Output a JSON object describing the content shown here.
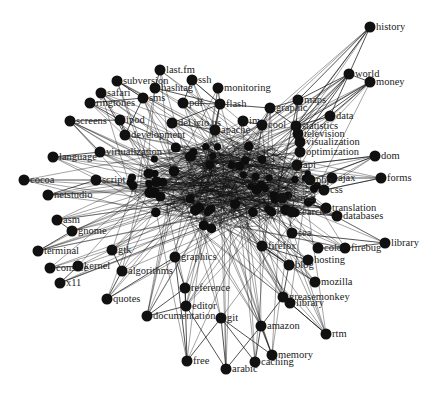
{
  "title": "",
  "colors": {
    "background": "#ffffff",
    "node": "#111111",
    "edge": "#1a1a1a",
    "label": "#222222"
  },
  "core": {
    "cx": 225,
    "cy": 185,
    "rx": 95,
    "ry": 45
  },
  "nodes": [
    {
      "id": "history",
      "label": "history",
      "x": 370,
      "y": 27
    },
    {
      "id": "world",
      "label": "world",
      "x": 349,
      "y": 74
    },
    {
      "id": "money",
      "label": "money",
      "x": 370,
      "y": 82
    },
    {
      "id": "maps",
      "label": "maps",
      "x": 298,
      "y": 100
    },
    {
      "id": "graphic",
      "label": "graphic",
      "x": 270,
      "y": 108
    },
    {
      "id": "data",
      "label": "data",
      "x": 330,
      "y": 116
    },
    {
      "id": "statistics",
      "label": "statistics",
      "x": 296,
      "y": 126
    },
    {
      "id": "television",
      "label": "television",
      "x": 298,
      "y": 134
    },
    {
      "id": "visualization",
      "label": "visualization",
      "x": 300,
      "y": 142
    },
    {
      "id": "optimization",
      "label": "optimization",
      "x": 300,
      "y": 152
    },
    {
      "id": "cool",
      "label": "cool",
      "x": 262,
      "y": 125
    },
    {
      "id": "im",
      "label": "im",
      "x": 243,
      "y": 121
    },
    {
      "id": "flash",
      "label": "flash",
      "x": 220,
      "y": 104
    },
    {
      "id": "monitoring",
      "label": "monitoring",
      "x": 218,
      "y": 88
    },
    {
      "id": "ssh",
      "label": "ssh",
      "x": 192,
      "y": 80
    },
    {
      "id": "pdf",
      "label": "pdf",
      "x": 183,
      "y": 103
    },
    {
      "id": "last.fm",
      "label": "last.fm",
      "x": 160,
      "y": 70
    },
    {
      "id": "hashtag",
      "label": "hashtag",
      "x": 155,
      "y": 88
    },
    {
      "id": "subversion",
      "label": "subversion",
      "x": 117,
      "y": 81
    },
    {
      "id": "safari",
      "label": "safari",
      "x": 101,
      "y": 93
    },
    {
      "id": "ringtones",
      "label": "ringtones",
      "x": 90,
      "y": 103
    },
    {
      "id": "sms",
      "label": "sms",
      "x": 143,
      "y": 98
    },
    {
      "id": "screens",
      "label": "screens",
      "x": 70,
      "y": 121
    },
    {
      "id": "ipod",
      "label": "ipod",
      "x": 120,
      "y": 120
    },
    {
      "id": "del.icio.us",
      "label": "del.icio.us",
      "x": 172,
      "y": 123
    },
    {
      "id": "apache",
      "label": "apache",
      "x": 215,
      "y": 130
    },
    {
      "id": "development",
      "label": "development",
      "x": 125,
      "y": 135
    },
    {
      "id": "virtualization",
      "label": "virtualization",
      "x": 100,
      "y": 152
    },
    {
      "id": "language",
      "label": "language",
      "x": 53,
      "y": 157
    },
    {
      "id": "cocoa",
      "label": "cocoa",
      "x": 24,
      "y": 180
    },
    {
      "id": "script",
      "label": "script",
      "x": 96,
      "y": 180
    },
    {
      "id": "netstudio",
      "label": "netstudio",
      "x": 48,
      "y": 195
    },
    {
      "id": "asm",
      "label": "asm",
      "x": 57,
      "y": 220
    },
    {
      "id": "gnome",
      "label": "gnome",
      "x": 72,
      "y": 231
    },
    {
      "id": "terminal",
      "label": "terminal",
      "x": 38,
      "y": 251
    },
    {
      "id": "console",
      "label": "console",
      "x": 50,
      "y": 268
    },
    {
      "id": "kernel",
      "label": "kernel",
      "x": 78,
      "y": 266
    },
    {
      "id": "x11",
      "label": "x11",
      "x": 60,
      "y": 283
    },
    {
      "id": "gtk",
      "label": "gtk",
      "x": 112,
      "y": 250
    },
    {
      "id": "algorithms",
      "label": "algorithms",
      "x": 122,
      "y": 271
    },
    {
      "id": "quotes",
      "label": "quotes",
      "x": 107,
      "y": 299
    },
    {
      "id": "graphics",
      "label": "graphics",
      "x": 175,
      "y": 257
    },
    {
      "id": "reference",
      "label": "reference",
      "x": 185,
      "y": 288
    },
    {
      "id": "editor",
      "label": "editor",
      "x": 186,
      "y": 306
    },
    {
      "id": "documentation",
      "label": "documentation",
      "x": 147,
      "y": 316
    },
    {
      "id": "git",
      "label": "git",
      "x": 221,
      "y": 318
    },
    {
      "id": "free",
      "label": "free",
      "x": 187,
      "y": 361
    },
    {
      "id": "arabic",
      "label": "arabic",
      "x": 226,
      "y": 369
    },
    {
      "id": "caching",
      "label": "caching",
      "x": 255,
      "y": 362
    },
    {
      "id": "memory",
      "label": "memory",
      "x": 272,
      "y": 355
    },
    {
      "id": "amazon",
      "label": "amazon",
      "x": 261,
      "y": 326
    },
    {
      "id": "greasemonkey",
      "label": "greasemonkey",
      "x": 283,
      "y": 297
    },
    {
      "id": "library2",
      "label": "library",
      "x": 290,
      "y": 303
    },
    {
      "id": "rtm",
      "label": "rtm",
      "x": 326,
      "y": 334
    },
    {
      "id": "mozilla",
      "label": "mozilla",
      "x": 315,
      "y": 282
    },
    {
      "id": "blog",
      "label": "blog",
      "x": 289,
      "y": 265
    },
    {
      "id": "hosting",
      "label": "hosting",
      "x": 308,
      "y": 260
    },
    {
      "id": "firefox",
      "label": "firefox",
      "x": 262,
      "y": 246
    },
    {
      "id": "color",
      "label": "color",
      "x": 318,
      "y": 248
    },
    {
      "id": "firebug",
      "label": "firebug",
      "x": 345,
      "y": 248
    },
    {
      "id": "library",
      "label": "library",
      "x": 385,
      "y": 243
    },
    {
      "id": "search2",
      "label": "sea",
      "x": 292,
      "y": 233
    },
    {
      "id": "databases",
      "label": "databases",
      "x": 337,
      "y": 216
    },
    {
      "id": "translation",
      "label": "translation",
      "x": 326,
      "y": 208
    },
    {
      "id": "search",
      "label": "search",
      "x": 292,
      "y": 212
    },
    {
      "id": "format",
      "label": "format",
      "x": 282,
      "y": 198
    },
    {
      "id": "css",
      "label": "css",
      "x": 324,
      "y": 190
    },
    {
      "id": "ajax",
      "label": "ajax",
      "x": 332,
      "y": 178
    },
    {
      "id": "php",
      "label": "php",
      "x": 310,
      "y": 180
    },
    {
      "id": "forms",
      "label": "forms",
      "x": 381,
      "y": 178
    },
    {
      "id": "dom",
      "label": "dom",
      "x": 375,
      "y": 156
    },
    {
      "id": "api",
      "label": "api",
      "x": 297,
      "y": 165
    }
  ],
  "edges": [
    [
      "history",
      "world"
    ],
    [
      "history",
      "maps"
    ],
    [
      "history",
      "statistics"
    ],
    [
      "world",
      "money"
    ],
    [
      "world",
      "maps"
    ],
    [
      "world",
      "data"
    ],
    [
      "world",
      "statistics"
    ],
    [
      "world",
      "television"
    ],
    [
      "world",
      "visualization"
    ],
    [
      "money",
      "statistics"
    ],
    [
      "money",
      "data"
    ],
    [
      "money",
      "television"
    ],
    [
      "maps",
      "graphic"
    ],
    [
      "maps",
      "statistics"
    ],
    [
      "graphic",
      "flash"
    ],
    [
      "graphic",
      "cool"
    ],
    [
      "graphic",
      "statistics"
    ],
    [
      "data",
      "statistics"
    ],
    [
      "flash",
      "monitoring"
    ],
    [
      "flash",
      "pdf"
    ],
    [
      "flash",
      "apache"
    ],
    [
      "flash",
      "del.icio.us"
    ],
    [
      "flash",
      "ssh"
    ],
    [
      "ssh",
      "pdf"
    ],
    [
      "last.fm",
      "hashtag"
    ],
    [
      "hashtag",
      "flash"
    ],
    [
      "subversion",
      "sms"
    ],
    [
      "safari",
      "development"
    ],
    [
      "ringtones",
      "ipod"
    ],
    [
      "ringtones",
      "sms"
    ],
    [
      "screens",
      "virtualization"
    ],
    [
      "screens",
      "ipod"
    ],
    [
      "ipod",
      "development"
    ],
    [
      "sms",
      "development"
    ],
    [
      "del.icio.us",
      "apache"
    ],
    [
      "im",
      "cool"
    ],
    [
      "language",
      "virtualization"
    ],
    [
      "cocoa",
      "script"
    ],
    [
      "netstudio",
      "script"
    ],
    [
      "asm",
      "gnome"
    ],
    [
      "terminal",
      "gnome"
    ],
    [
      "console",
      "kernel"
    ],
    [
      "x11",
      "kernel"
    ],
    [
      "gtk",
      "algorithms"
    ],
    [
      "algorithms",
      "quotes"
    ],
    [
      "graphics",
      "reference"
    ],
    [
      "reference",
      "editor"
    ],
    [
      "editor",
      "documentation"
    ],
    [
      "git",
      "free"
    ],
    [
      "git",
      "arabic"
    ],
    [
      "editor",
      "arabic"
    ],
    [
      "reference",
      "free"
    ],
    [
      "amazon",
      "caching"
    ],
    [
      "amazon",
      "memory"
    ],
    [
      "greasemonkey",
      "amazon"
    ],
    [
      "greasemonkey",
      "rtm"
    ],
    [
      "library2",
      "rtm"
    ],
    [
      "blog",
      "greasemonkey"
    ],
    [
      "firefox",
      "mozilla"
    ],
    [
      "firefox",
      "blog"
    ],
    [
      "firefox",
      "hosting"
    ],
    [
      "color",
      "firebug"
    ],
    [
      "firebug",
      "library"
    ],
    [
      "search2",
      "library"
    ],
    [
      "search",
      "databases"
    ],
    [
      "format",
      "translation"
    ],
    [
      "css",
      "forms"
    ],
    [
      "php",
      "dom"
    ],
    [
      "ajax",
      "forms"
    ],
    [
      "api",
      "dom"
    ],
    [
      "documentation",
      "reference"
    ],
    [
      "free",
      "graphics"
    ],
    [
      "arabic",
      "amazon"
    ],
    [
      "caching",
      "git"
    ],
    [
      "memory",
      "git"
    ],
    [
      "quotes",
      "graphics"
    ]
  ],
  "hub_edges_count": 320
}
